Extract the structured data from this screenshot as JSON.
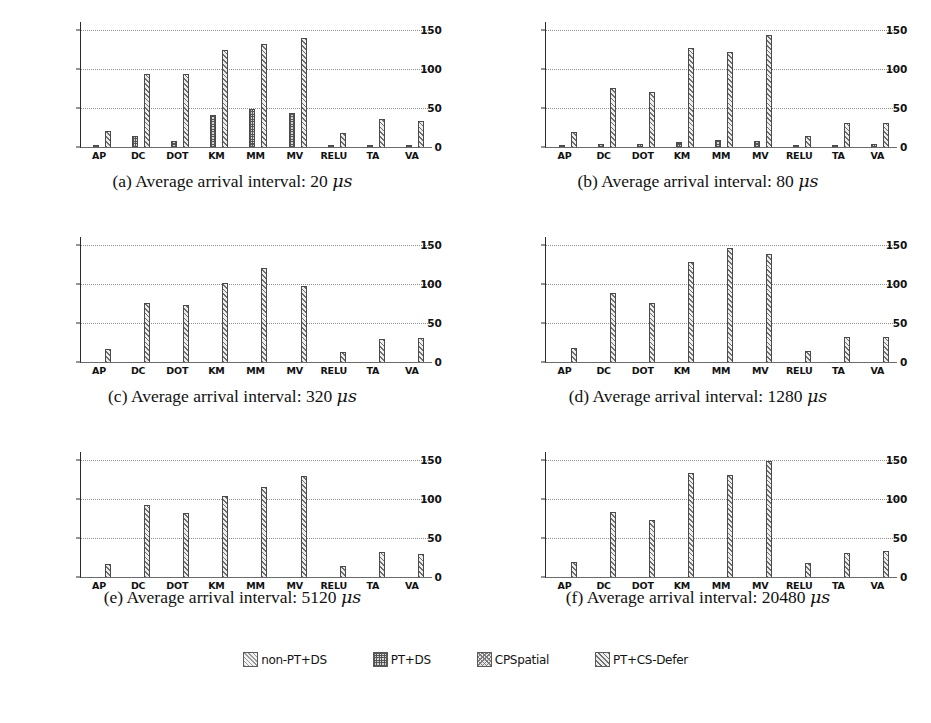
{
  "figure": {
    "categories": [
      "AP",
      "DC",
      "DOT",
      "KM",
      "MM",
      "MV",
      "RELU",
      "TA",
      "VA"
    ],
    "y_ticks": [
      0,
      50,
      100,
      150
    ],
    "ylim": [
      0,
      160
    ],
    "series_names": [
      "non-PT+DS",
      "PT+DS",
      "CPSpatial",
      "PT+CS-Defer"
    ]
  },
  "legend": {
    "position": "bottom-center",
    "items": [
      {
        "label": "non-PT+DS",
        "swatch": "hatch-light-diagonal"
      },
      {
        "label": "PT+DS",
        "swatch": "hatch-dense-crosshatch"
      },
      {
        "label": "CPSpatial",
        "swatch": "hatch-medium-crosshatch"
      },
      {
        "label": "PT+CS-Defer",
        "swatch": "hatch-diagonal"
      }
    ]
  },
  "panels": [
    {
      "id": "a",
      "caption_prefix": "(a)",
      "caption_text": "Average arrival interval: 20",
      "caption_unit": "μs"
    },
    {
      "id": "b",
      "caption_prefix": "(b)",
      "caption_text": "Average arrival interval: 80",
      "caption_unit": "μs"
    },
    {
      "id": "c",
      "caption_prefix": "(c)",
      "caption_text": "Average arrival interval: 320",
      "caption_unit": "μs"
    },
    {
      "id": "d",
      "caption_prefix": "(d)",
      "caption_text": "Average arrival interval: 1280",
      "caption_unit": "μs"
    },
    {
      "id": "e",
      "caption_prefix": "(e)",
      "caption_text": "Average arrival interval: 5120",
      "caption_unit": "μs"
    },
    {
      "id": "f",
      "caption_prefix": "(f)",
      "caption_text": "Average arrival interval: 20480",
      "caption_unit": "μs"
    }
  ],
  "chart_data": [
    {
      "type": "bar",
      "title": "(a) Average arrival interval: 20 μs",
      "xlabel": "",
      "ylabel": "",
      "ylim": [
        0,
        160
      ],
      "yticks": [
        0,
        50,
        100,
        150
      ],
      "grid": true,
      "categories": [
        "AP",
        "DC",
        "DOT",
        "KM",
        "MM",
        "MV",
        "RELU",
        "TA",
        "VA"
      ],
      "series": [
        {
          "name": "non-PT+DS",
          "values": [
            0,
            0,
            0,
            0,
            0,
            0,
            0,
            0,
            0
          ]
        },
        {
          "name": "PT+DS",
          "values": [
            2,
            14,
            8,
            41,
            49,
            43,
            2,
            2,
            2
          ]
        },
        {
          "name": "CPSpatial",
          "values": [
            0,
            0,
            0,
            0,
            0,
            0,
            0,
            0,
            0
          ]
        },
        {
          "name": "PT+CS-Defer",
          "values": [
            20,
            93,
            93,
            124,
            132,
            140,
            18,
            36,
            33
          ]
        }
      ]
    },
    {
      "type": "bar",
      "title": "(b) Average arrival interval: 80 μs",
      "xlabel": "",
      "ylabel": "",
      "ylim": [
        0,
        160
      ],
      "yticks": [
        0,
        50,
        100,
        150
      ],
      "grid": true,
      "categories": [
        "AP",
        "DC",
        "DOT",
        "KM",
        "MM",
        "MV",
        "RELU",
        "TA",
        "VA"
      ],
      "series": [
        {
          "name": "non-PT+DS",
          "values": [
            0,
            0,
            0,
            0,
            0,
            0,
            0,
            0,
            0
          ]
        },
        {
          "name": "PT+DS",
          "values": [
            2,
            4,
            4,
            7,
            9,
            8,
            1,
            3,
            4
          ]
        },
        {
          "name": "CPSpatial",
          "values": [
            0,
            0,
            0,
            0,
            0,
            0,
            0,
            0,
            0
          ]
        },
        {
          "name": "PT+CS-Defer",
          "values": [
            19,
            75,
            71,
            127,
            121,
            144,
            14,
            31,
            31
          ]
        }
      ]
    },
    {
      "type": "bar",
      "title": "(c) Average arrival interval: 320 μs",
      "xlabel": "",
      "ylabel": "",
      "ylim": [
        0,
        160
      ],
      "yticks": [
        0,
        50,
        100,
        150
      ],
      "grid": true,
      "categories": [
        "AP",
        "DC",
        "DOT",
        "KM",
        "MM",
        "MV",
        "RELU",
        "TA",
        "VA"
      ],
      "series": [
        {
          "name": "non-PT+DS",
          "values": [
            0,
            0,
            0,
            0,
            0,
            0,
            0,
            0,
            0
          ]
        },
        {
          "name": "PT+DS",
          "values": [
            0,
            0,
            0,
            0,
            0,
            0,
            0,
            0,
            0
          ]
        },
        {
          "name": "CPSpatial",
          "values": [
            0,
            0,
            0,
            0,
            0,
            0,
            0,
            0,
            0
          ]
        },
        {
          "name": "PT+CS-Defer",
          "values": [
            17,
            76,
            73,
            101,
            120,
            97,
            13,
            30,
            31
          ]
        }
      ]
    },
    {
      "type": "bar",
      "title": "(d) Average arrival interval: 1280 μs",
      "xlabel": "",
      "ylabel": "",
      "ylim": [
        0,
        160
      ],
      "yticks": [
        0,
        50,
        100,
        150
      ],
      "grid": true,
      "categories": [
        "AP",
        "DC",
        "DOT",
        "KM",
        "MM",
        "MV",
        "RELU",
        "TA",
        "VA"
      ],
      "series": [
        {
          "name": "non-PT+DS",
          "values": [
            0,
            0,
            0,
            0,
            0,
            0,
            0,
            0,
            0
          ]
        },
        {
          "name": "PT+DS",
          "values": [
            0,
            0,
            0,
            0,
            0,
            0,
            0,
            0,
            0
          ]
        },
        {
          "name": "CPSpatial",
          "values": [
            0,
            0,
            0,
            0,
            0,
            0,
            0,
            0,
            0
          ]
        },
        {
          "name": "PT+CS-Defer",
          "values": [
            18,
            88,
            76,
            128,
            146,
            138,
            14,
            32,
            32
          ]
        }
      ]
    },
    {
      "type": "bar",
      "title": "(e) Average arrival interval: 5120 μs",
      "xlabel": "",
      "ylabel": "",
      "ylim": [
        0,
        160
      ],
      "yticks": [
        0,
        50,
        100,
        150
      ],
      "grid": true,
      "categories": [
        "AP",
        "DC",
        "DOT",
        "KM",
        "MM",
        "MV",
        "RELU",
        "TA",
        "VA"
      ],
      "series": [
        {
          "name": "non-PT+DS",
          "values": [
            0,
            0,
            0,
            0,
            0,
            0,
            0,
            0,
            0
          ]
        },
        {
          "name": "PT+DS",
          "values": [
            0,
            0,
            0,
            0,
            0,
            0,
            0,
            0,
            0
          ]
        },
        {
          "name": "CPSpatial",
          "values": [
            0,
            0,
            0,
            0,
            0,
            0,
            0,
            0,
            0
          ]
        },
        {
          "name": "PT+CS-Defer",
          "values": [
            17,
            92,
            82,
            104,
            115,
            129,
            14,
            32,
            30
          ]
        }
      ]
    },
    {
      "type": "bar",
      "title": "(f) Average arrival interval: 20480 μs",
      "xlabel": "",
      "ylabel": "",
      "ylim": [
        0,
        160
      ],
      "yticks": [
        0,
        50,
        100,
        150
      ],
      "grid": true,
      "categories": [
        "AP",
        "DC",
        "DOT",
        "KM",
        "MM",
        "MV",
        "RELU",
        "TA",
        "VA"
      ],
      "series": [
        {
          "name": "non-PT+DS",
          "values": [
            0,
            0,
            0,
            0,
            0,
            0,
            0,
            0,
            0
          ]
        },
        {
          "name": "PT+DS",
          "values": [
            0,
            0,
            0,
            0,
            0,
            0,
            0,
            0,
            0
          ]
        },
        {
          "name": "CPSpatial",
          "values": [
            0,
            0,
            0,
            0,
            0,
            0,
            0,
            0,
            0
          ]
        },
        {
          "name": "PT+CS-Defer",
          "values": [
            19,
            83,
            73,
            133,
            131,
            148,
            18,
            31,
            33
          ]
        }
      ]
    }
  ]
}
